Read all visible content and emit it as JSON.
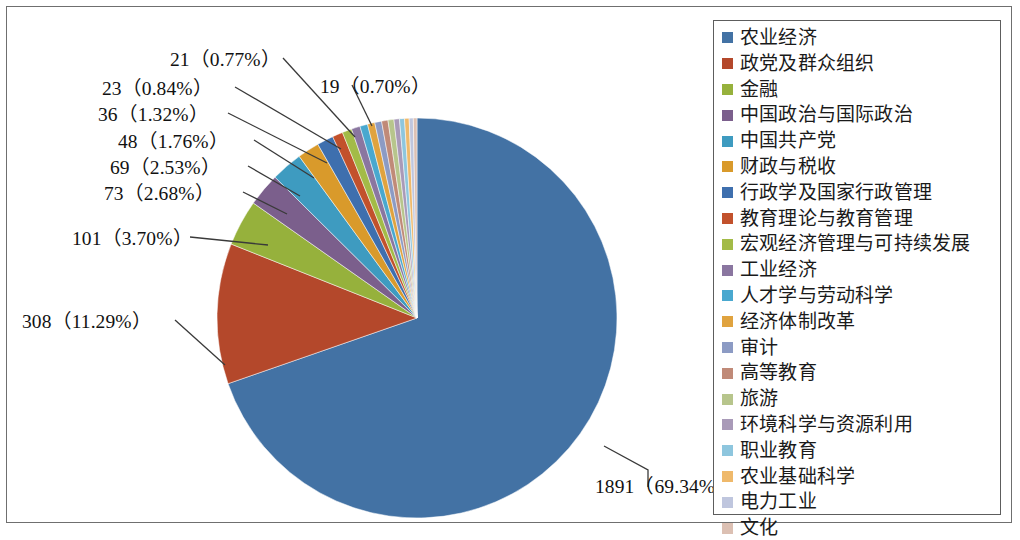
{
  "chart_data": {
    "type": "pie",
    "title": "",
    "total": 2727,
    "legend_position": "right",
    "start_angle_deg": 0,
    "direction": "clockwise",
    "categories": [
      "农业经济",
      "政党及群众组织",
      "金融",
      "中国政治与国际政治",
      "中国共产党",
      "财政与税收",
      "行政学及国家行政管理",
      "教育理论与教育管理",
      "宏观经济管理与可持续发展",
      "工业经济",
      "人才学与劳动科学",
      "经济体制改革",
      "审计",
      "高等教育",
      "旅游",
      "环境科学与资源利用",
      "职业教育",
      "农业基础科学",
      "电力工业",
      "文化"
    ],
    "values": [
      1891,
      308,
      101,
      73,
      69,
      48,
      36,
      23,
      21,
      19,
      17,
      16,
      15,
      14,
      13,
      12,
      11,
      10,
      9,
      8
    ],
    "percents": [
      69.34,
      11.29,
      3.7,
      2.68,
      2.53,
      1.76,
      1.32,
      0.84,
      0.77,
      0.7,
      0.62,
      0.59,
      0.55,
      0.51,
      0.48,
      0.44,
      0.4,
      0.37,
      0.33,
      0.29
    ],
    "colors": [
      "#4372A4",
      "#B4482B",
      "#96B13C",
      "#7B5F8C",
      "#3E9BC0",
      "#D99A2B",
      "#3E6FAE",
      "#C2512C",
      "#A3BB47",
      "#8A76A0",
      "#49A8CF",
      "#E0A33F",
      "#8C9BC4",
      "#C08A78",
      "#B7C58C",
      "#A99AB8",
      "#8EC6DE",
      "#EFB96B",
      "#BFC6DE",
      "#DCC0B3"
    ],
    "labeled_slices": [
      {
        "index": 0,
        "text": "1891（69.34%）"
      },
      {
        "index": 1,
        "text": "308（11.29%）"
      },
      {
        "index": 2,
        "text": "101（3.70%）"
      },
      {
        "index": 3,
        "text": "73（2.68%）"
      },
      {
        "index": 4,
        "text": "69（2.53%）"
      },
      {
        "index": 5,
        "text": "48（1.76%）"
      },
      {
        "index": 6,
        "text": "36（1.32%）"
      },
      {
        "index": 7,
        "text": "23（0.84%）"
      },
      {
        "index": 8,
        "text": "21（0.77%）"
      },
      {
        "index": 9,
        "text": "19（0.70%）"
      }
    ],
    "xlabel": "",
    "ylabel": "",
    "grid": false
  },
  "legend": {
    "items": [
      {
        "label": "农业经济",
        "color": "#4372A4"
      },
      {
        "label": "政党及群众组织",
        "color": "#B4482B"
      },
      {
        "label": "金融",
        "color": "#96B13C"
      },
      {
        "label": "中国政治与国际政治",
        "color": "#7B5F8C"
      },
      {
        "label": "中国共产党",
        "color": "#3E9BC0"
      },
      {
        "label": "财政与税收",
        "color": "#D99A2B"
      },
      {
        "label": "行政学及国家行政管理",
        "color": "#3E6FAE"
      },
      {
        "label": "教育理论与教育管理",
        "color": "#C2512C"
      },
      {
        "label": "宏观经济管理与可持续发展",
        "color": "#A3BB47"
      },
      {
        "label": "工业经济",
        "color": "#8A76A0"
      },
      {
        "label": "人才学与劳动科学",
        "color": "#49A8CF"
      },
      {
        "label": "经济体制改革",
        "color": "#E0A33F"
      },
      {
        "label": "审计",
        "color": "#8C9BC4"
      },
      {
        "label": "高等教育",
        "color": "#C08A78"
      },
      {
        "label": "旅游",
        "color": "#B7C58C"
      },
      {
        "label": "环境科学与资源利用",
        "color": "#A99AB8"
      },
      {
        "label": "职业教育",
        "color": "#8EC6DE"
      },
      {
        "label": "农业基础科学",
        "color": "#EFB96B"
      },
      {
        "label": "电力工业",
        "color": "#BFC6DE"
      },
      {
        "label": "文化",
        "color": "#DCC0B3"
      }
    ]
  },
  "labels": {
    "l_1891": "1891（69.34%）",
    "l_308": "308（11.29%）",
    "l_101": "101（3.70%）",
    "l_73": "73（2.68%）",
    "l_69": "69（2.53%）",
    "l_48": "48（1.76%）",
    "l_36": "36（1.32%）",
    "l_23": "23（0.84%）",
    "l_21": "21（0.77%）",
    "l_19": "19（0.70%）"
  }
}
